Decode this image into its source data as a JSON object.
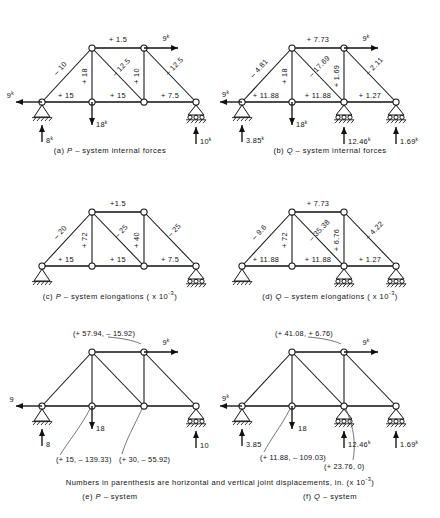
{
  "figure": {
    "note": "Numbers in parenthesis are horizontal and vertical joint displacements, in. (x 10",
    "note_exp": "-3",
    "note_tail": ")"
  },
  "panels": {
    "a": {
      "caption_id": "(a)",
      "caption_sys": "P",
      "caption_text": "– system  internal forces",
      "members": {
        "top_chord": "+ 1.5",
        "left_diag": "– 10",
        "center_vert": "+ 18",
        "mid_diag": "– 12.5",
        "right_vert": "+ 10",
        "right_diag": "– 12.5",
        "bot_left": "+ 15",
        "bot_mid": "+ 15",
        "bot_right": "+ 7.5"
      },
      "loads": {
        "left_horiz": "9",
        "left_horiz_sup": "k",
        "top_right": "9",
        "top_right_sup": "k",
        "mid_down": "18",
        "mid_down_sup": "k",
        "react_left": "8",
        "react_left_sup": "k",
        "react_right": "10",
        "react_right_sup": "k"
      },
      "supports": {
        "left": "pin",
        "right": "roller"
      }
    },
    "b": {
      "caption_id": "(b)",
      "caption_sys": "Q",
      "caption_text": "– system  internal forces",
      "members": {
        "top_chord": "+ 7.73",
        "left_diag": "– 4.81",
        "center_vert": "+ 18",
        "mid_diag": "– 17.69",
        "right_vert": "+ 1.69",
        "right_diag": "– 2.11",
        "bot_left": "+ 11.88",
        "bot_mid": "+ 11.88",
        "bot_right": "+ 1.27"
      },
      "loads": {
        "left_horiz": "9",
        "left_horiz_sup": "k",
        "top_right": "9",
        "top_right_sup": "k",
        "mid_down": "18",
        "mid_down_sup": "k",
        "react_left": "3.85",
        "react_left_sup": "k",
        "react_mid": "12.46",
        "react_mid_sup": "k",
        "react_right": "1.69",
        "react_right_sup": "k"
      },
      "supports": {
        "left": "pin",
        "mid": "roller",
        "right": "roller"
      }
    },
    "c": {
      "caption_id": "(c)",
      "caption_sys": "P",
      "caption_text": "– system elongations  ( x 10",
      "caption_exp": "-3",
      "caption_tail": ")",
      "members": {
        "top_chord": "+1.5",
        "left_diag": "– 20",
        "center_vert": "+ 72",
        "mid_diag": "– 25",
        "right_vert": "+ 40",
        "right_diag": "– 25",
        "bot_left": "+ 15",
        "bot_mid": "+ 15",
        "bot_right": "+ 7.5"
      },
      "supports": {
        "left": "pin",
        "right": "roller"
      }
    },
    "d": {
      "caption_id": "(d)",
      "caption_sys": "Q",
      "caption_text": "– system elongations  ( x 10",
      "caption_exp": "-3",
      "caption_tail": ")",
      "members": {
        "top_chord": "+ 7.73",
        "left_diag": "– 9.6",
        "center_vert": "+ 72",
        "mid_diag": "– 35.38",
        "right_vert": "+ 6.76",
        "right_diag": "– 4.22",
        "bot_left": "+ 11.88",
        "bot_mid": "+ 11.88",
        "bot_right": "+ 1.27"
      },
      "supports": {
        "left": "pin",
        "mid": "roller",
        "right": "roller"
      }
    },
    "e": {
      "caption_id": "(e)",
      "caption_sys": "P",
      "caption_text": "– system",
      "displacements": {
        "top_left": "(+ 57.94, – 15.92)",
        "bot_mid": "(+ 15, – 139.33)",
        "bot_third": "(+ 30, – 55.92)"
      },
      "loads": {
        "left_horiz": "9",
        "top_right": "9",
        "top_right_sup": "k",
        "mid_down": "18",
        "react_left": "8",
        "react_right": "10"
      },
      "supports": {
        "left": "pin",
        "right": "roller"
      }
    },
    "f": {
      "caption_id": "(f)",
      "caption_sys": "Q",
      "caption_text": "– system",
      "displacements": {
        "top_left": "(+ 41.08, + 6.76)",
        "bot_mid": "(+ 11.88, – 109.03)",
        "bot_third": "(+ 23.76, 0)"
      },
      "loads": {
        "left_horiz": "9",
        "left_horiz_sup": "k",
        "top_right": "9",
        "top_right_sup": "k",
        "mid_down": "18",
        "react_left": "3.85",
        "react_mid": "12.46",
        "react_mid_sup": "k",
        "react_right": "1.69",
        "react_right_sup": "k"
      },
      "supports": {
        "left": "pin",
        "mid": "roller",
        "right": "roller"
      }
    }
  }
}
